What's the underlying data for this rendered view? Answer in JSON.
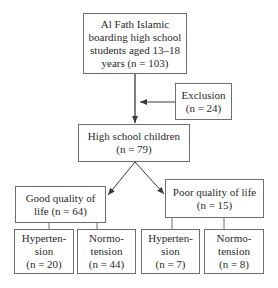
{
  "flowchart": {
    "root": {
      "lines": [
        "Al Fath Islamic",
        "boarding high school",
        "students aged 13–18",
        "years (n = 103)"
      ]
    },
    "exclusion": {
      "lines": [
        "Exclusion",
        "(n = 24)"
      ]
    },
    "high_school": {
      "lines": [
        "High school children",
        "(n = 79)"
      ]
    },
    "good_qol": {
      "lines": [
        "Good quality of",
        "life (n = 64)"
      ]
    },
    "poor_qol": {
      "lines": [
        "Poor quality of life",
        "(n = 15)"
      ]
    },
    "good_hyper": {
      "lines": [
        "Hyperten-",
        "sion",
        "(n = 20)"
      ]
    },
    "good_normo": {
      "lines": [
        "Normo-",
        "tension",
        "(n = 44)"
      ]
    },
    "poor_hyper": {
      "lines": [
        "Hyperten-",
        "sion",
        "(n = 7)"
      ]
    },
    "poor_normo": {
      "lines": [
        "Normo-",
        "tension",
        "(n = 8)"
      ]
    }
  }
}
